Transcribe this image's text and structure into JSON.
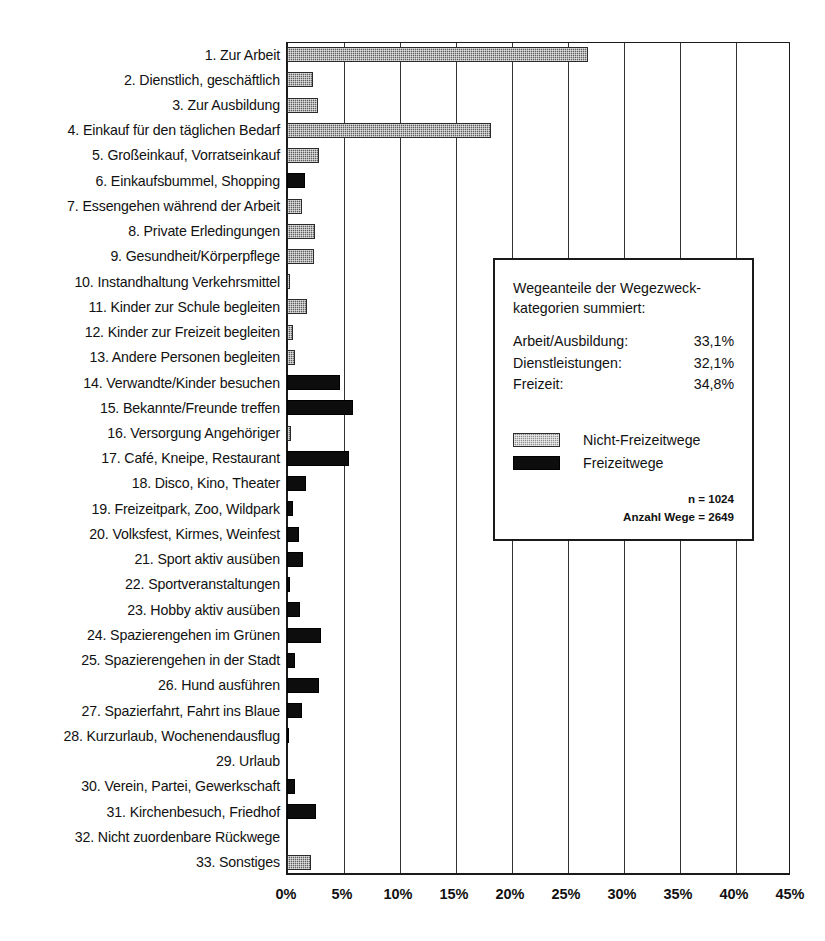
{
  "chart_data": {
    "type": "bar",
    "orientation": "horizontal",
    "title": "",
    "xlabel": "",
    "ylabel": "",
    "xlim": [
      0,
      45
    ],
    "xticks": [
      "0%",
      "5%",
      "10%",
      "15%",
      "20%",
      "25%",
      "30%",
      "35%",
      "40%",
      "45%"
    ],
    "xtick_values": [
      0,
      5,
      10,
      15,
      20,
      25,
      30,
      35,
      40,
      45
    ],
    "grid": "vertical",
    "legend_position": "inset-right",
    "categories": [
      "1. Zur Arbeit",
      "2. Dienstlich, geschäftlich",
      "3. Zur Ausbildung",
      "4. Einkauf für den täglichen Bedarf",
      "5. Großeinkauf, Vorratseinkauf",
      "6. Einkaufsbummel, Shopping",
      "7. Essengehen während der Arbeit",
      "8. Private Erledingungen",
      "9. Gesundheit/Körperpflege",
      "10. Instandhaltung Verkehrsmittel",
      "11. Kinder zur Schule begleiten",
      "12. Kinder zur Freizeit begleiten",
      "13. Andere Personen begleiten",
      "14. Verwandte/Kinder besuchen",
      "15. Bekannte/Freunde treffen",
      "16. Versorgung Angehöriger",
      "17. Café, Kneipe, Restaurant",
      "18. Disco, Kino, Theater",
      "19. Freizeitpark, Zoo, Wildpark",
      "20. Volksfest, Kirmes, Weinfest",
      "21. Sport aktiv ausüben",
      "22. Sportveranstaltungen",
      "23. Hobby aktiv ausüben",
      "24. Spazierengehen im Grünen",
      "25. Spazierengehen in der Stadt",
      "26. Hund ausführen",
      "27. Spazierfahrt, Fahrt ins Blaue",
      "28. Kurzurlaub, Wochenendausflug",
      "29. Urlaub",
      "30. Verein, Partei, Gewerkschaft",
      "31. Kirchenbesuch, Friedhof",
      "32. Nicht zuordenbare Rückwege",
      "33. Sonstiges"
    ],
    "values": [
      26.9,
      2.3,
      2.8,
      18.2,
      2.9,
      1.6,
      1.3,
      2.5,
      2.4,
      0.3,
      1.8,
      0.5,
      0.7,
      4.7,
      5.9,
      0.4,
      5.5,
      1.7,
      0.5,
      1.1,
      1.4,
      0.3,
      1.2,
      3.0,
      0.7,
      2.9,
      1.3,
      0.2,
      0.0,
      0.7,
      2.6,
      0.0,
      2.1
    ],
    "series_of": [
      "nicht",
      "nicht",
      "nicht",
      "nicht",
      "nicht",
      "freizeit",
      "nicht",
      "nicht",
      "nicht",
      "nicht",
      "nicht",
      "nicht",
      "nicht",
      "freizeit",
      "freizeit",
      "nicht",
      "freizeit",
      "freizeit",
      "freizeit",
      "freizeit",
      "freizeit",
      "freizeit",
      "freizeit",
      "freizeit",
      "freizeit",
      "freizeit",
      "freizeit",
      "freizeit",
      "freizeit",
      "freizeit",
      "freizeit",
      "nicht",
      "nicht"
    ],
    "series": [
      {
        "name": "Nicht-Freizeitwege",
        "color": "#5e5e5e"
      },
      {
        "name": "Freizeitwege",
        "color": "#0d0d0d"
      }
    ]
  },
  "infobox": {
    "title_line1": "Wegeanteile der Wegezweck-",
    "title_line2": "kategorien summiert:",
    "rows": [
      {
        "label": "Arbeit/Ausbildung:",
        "value": "33,1%"
      },
      {
        "label": "Dienstleistungen:",
        "value": "32,1%"
      },
      {
        "label": "Freizeit:",
        "value": "34,8%"
      }
    ],
    "legend": [
      {
        "key": "nicht",
        "label": "Nicht-Freizeitwege"
      },
      {
        "key": "freizeit",
        "label": "Freizeitwege"
      }
    ],
    "note_n": "n = 1024",
    "note_wege": "Anzahl Wege = 2649"
  },
  "colors": {
    "nicht_freizeitwege": "#5e5e5e",
    "freizeitwege": "#0d0d0d",
    "axis": "#1a1a1a",
    "gridline": "#333333",
    "background": "#ffffff"
  }
}
